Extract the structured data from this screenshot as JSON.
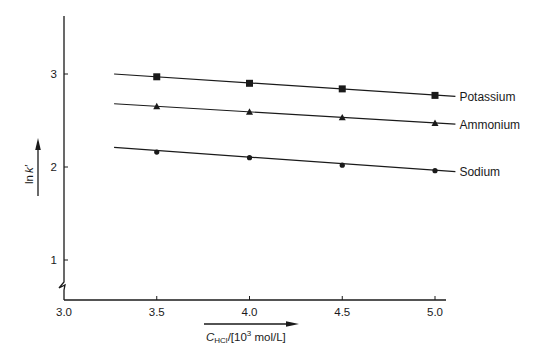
{
  "chart_data": {
    "type": "line",
    "title": "",
    "xlabel": "C_HCl/[10^3 mol/L]",
    "ylabel": "ln k′",
    "xlim": [
      3.0,
      5.05
    ],
    "ylim": [
      0.65,
      3.6
    ],
    "x_ticks": [
      3.0,
      3.5,
      4.0,
      4.5,
      5.0
    ],
    "x_tick_labels": [
      "3.0",
      "3.5",
      "4.0",
      "4.5",
      "5.0"
    ],
    "y_ticks": [
      1,
      2,
      3
    ],
    "y_tick_labels": [
      "1",
      "2",
      "3"
    ],
    "y_axis_break": true,
    "grid": false,
    "legend_position": "inline-right",
    "x": [
      3.5,
      4.0,
      4.5,
      5.0
    ],
    "series": [
      {
        "name": "Potassium",
        "marker": "square",
        "values": [
          2.97,
          2.9,
          2.84,
          2.77
        ],
        "fit_start": [
          3.27,
          3.0
        ],
        "fit_end": [
          5.11,
          2.76
        ]
      },
      {
        "name": "Ammonium",
        "marker": "triangle",
        "values": [
          2.65,
          2.59,
          2.53,
          2.47
        ],
        "fit_start": [
          3.27,
          2.68
        ],
        "fit_end": [
          5.11,
          2.46
        ]
      },
      {
        "name": "Sodium",
        "marker": "circle",
        "values": [
          2.16,
          2.1,
          2.02,
          1.96
        ],
        "fit_start": [
          3.27,
          2.21
        ],
        "fit_end": [
          5.11,
          1.95
        ]
      }
    ]
  },
  "labels": {
    "y_axis": {
      "main": "ln",
      "italic": "k′"
    },
    "x_axis": {
      "c": "C",
      "sub": "HCl",
      "rest1": "/[10",
      "sup": "3",
      "rest2": " mol/L]"
    }
  },
  "colors": {
    "ink": "#1a1a1a",
    "background": "#ffffff"
  }
}
